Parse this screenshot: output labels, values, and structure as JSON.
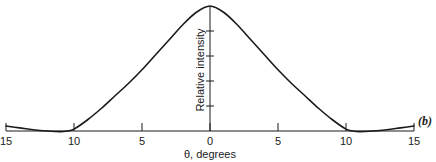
{
  "chart_data": {
    "type": "line",
    "title": "",
    "panel_label": "(b)",
    "xlabel": "θ, degrees",
    "ylabel": "Relative intensity",
    "xlim": [
      -15,
      15
    ],
    "ylim": [
      0,
      1
    ],
    "x_ticks": [
      -15,
      -10,
      -5,
      0,
      5,
      10,
      15
    ],
    "x_tick_labels": [
      "15",
      "10",
      "5",
      "0",
      "5",
      "10",
      "15"
    ],
    "y_ticks": [
      0.2,
      0.4,
      0.6,
      0.8
    ],
    "y_tick_labels": [],
    "grid": false,
    "legend": null,
    "series": [
      {
        "name": "Relative intensity",
        "x": [
          -15,
          -14,
          -13,
          -12,
          -11,
          -10.5,
          -10,
          -9,
          -8,
          -7,
          -6,
          -5,
          -4,
          -3,
          -2,
          -1,
          0,
          1,
          2,
          3,
          4,
          5,
          6,
          7,
          8,
          9,
          10,
          10.5,
          11,
          12,
          13,
          14,
          15
        ],
        "y": [
          0.04,
          0.025,
          0.01,
          0.0,
          -0.005,
          0.0,
          0.015,
          0.09,
          0.18,
          0.28,
          0.38,
          0.49,
          0.61,
          0.73,
          0.85,
          0.95,
          1.0,
          0.95,
          0.85,
          0.73,
          0.61,
          0.49,
          0.38,
          0.28,
          0.18,
          0.09,
          0.015,
          0.0,
          -0.005,
          0.0,
          0.01,
          0.025,
          0.04
        ]
      }
    ]
  }
}
